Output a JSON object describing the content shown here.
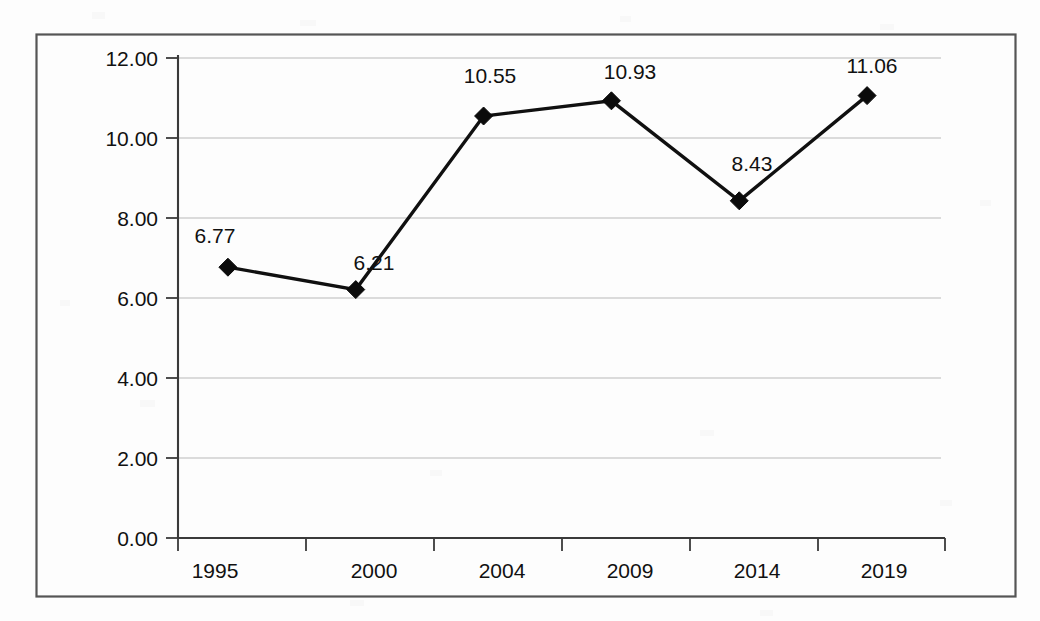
{
  "chart_data": {
    "type": "line",
    "title": "",
    "subtitle": "",
    "xlabel": "",
    "ylabel": "",
    "categories": [
      "1995",
      "2000",
      "2004",
      "2009",
      "2014",
      "2019"
    ],
    "values": [
      6.77,
      6.21,
      10.55,
      10.93,
      8.43,
      11.06
    ],
    "data_labels": [
      "6.77",
      "6.21",
      "10.55",
      "10.93",
      "8.43",
      "11.06"
    ],
    "series": [
      {
        "name": "",
        "values": [
          6.77,
          6.21,
          10.55,
          10.93,
          8.43,
          11.06
        ],
        "marker": "diamond",
        "marker_color": "#0b0b0b",
        "line_color": "#101010"
      }
    ],
    "ylim": [
      0,
      12
    ],
    "y_ticks": [
      0,
      2,
      4,
      6,
      8,
      10,
      12
    ],
    "y_tick_labels": [
      "0.00",
      "2.00",
      "4.00",
      "6.00",
      "8.00",
      "10.00",
      "12.00"
    ],
    "x_tick_labels": [
      "1995",
      "2000",
      "2004",
      "2009",
      "2014",
      "2019"
    ],
    "grid": true,
    "grid_axis": "y",
    "legend": false,
    "legend_position": "none",
    "show_data_labels": true,
    "colors": {
      "line": "#101010",
      "marker": "#0b0b0b",
      "gridline": "#b9b9b9",
      "axis": "#3a3a3a",
      "frame": "#555555",
      "text": "#111111",
      "background": "#fdfdfd"
    }
  },
  "frame": {
    "border_label": "chart-outer-border"
  }
}
